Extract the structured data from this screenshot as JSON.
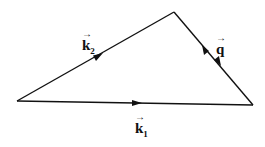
{
  "diagram": {
    "type": "vector-triangle",
    "vertices": {
      "left": [
        17,
        101
      ],
      "top": [
        174,
        12
      ],
      "right": [
        253,
        105
      ]
    },
    "edges": [
      {
        "from": "left",
        "to": "top",
        "label": "k",
        "subscript": "2",
        "arrow": "toward-top"
      },
      {
        "from": "top",
        "to": "right",
        "label": "q",
        "subscript": "",
        "arrow": "double-opposing"
      },
      {
        "from": "left",
        "to": "right",
        "label": "k",
        "subscript": "1",
        "arrow": "toward-right"
      }
    ],
    "labels": {
      "k2": {
        "text": "k",
        "sub": "2",
        "arrow": "→"
      },
      "q": {
        "text": "q",
        "sub": "",
        "arrow": "→"
      },
      "k1": {
        "text": "k",
        "sub": "1",
        "arrow": "→"
      }
    },
    "stroke_color": "#111111",
    "background": "#ffffff"
  }
}
